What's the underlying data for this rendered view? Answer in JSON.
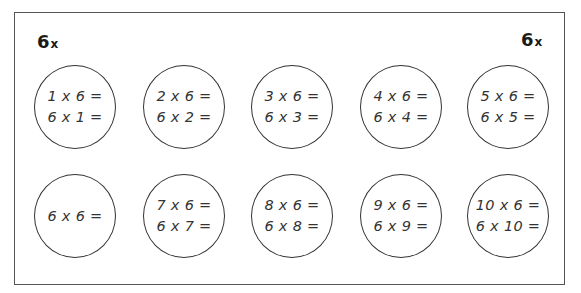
{
  "worksheet": {
    "title_left": {
      "number": "6",
      "symbol": "x"
    },
    "title_right": {
      "number": "6",
      "symbol": "x"
    },
    "circles": [
      {
        "lines": [
          "1 x 6 =",
          "6 x 1 ="
        ]
      },
      {
        "lines": [
          "2 x 6 =",
          "6 x 2 ="
        ]
      },
      {
        "lines": [
          "3 x 6 =",
          "6 x 3 ="
        ]
      },
      {
        "lines": [
          "4 x 6 =",
          "6 x 4 ="
        ]
      },
      {
        "lines": [
          "5 x 6 =",
          "6 x 5 ="
        ]
      },
      {
        "lines": [
          "6 x 6 ="
        ]
      },
      {
        "lines": [
          "7 x 6 =",
          "6 x 7 ="
        ]
      },
      {
        "lines": [
          "8 x 6 =",
          "6 x 8 ="
        ]
      },
      {
        "lines": [
          "9 x 6 =",
          "6 x 9 ="
        ]
      },
      {
        "lines": [
          "10 x 6 =",
          "6 x 10 ="
        ]
      }
    ]
  },
  "colors": {
    "border": "#555555",
    "circle_stroke": "#333333",
    "text": "#333333",
    "label": "#1a1a1a"
  }
}
